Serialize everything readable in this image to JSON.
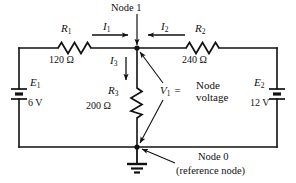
{
  "diagram": {
    "ink_color": "#111111",
    "background_color": "#ffffff"
  },
  "nodes": {
    "node1": {
      "label": "Node 1",
      "x": 137,
      "y": 48
    },
    "node0": {
      "label": "Node 0",
      "sublabel": "(reference node)",
      "x": 137,
      "y": 147
    }
  },
  "sources": [
    {
      "id": "E1",
      "symbol": "E",
      "subscript": "1",
      "value": "6 V",
      "side": "left"
    },
    {
      "id": "E2",
      "symbol": "E",
      "subscript": "2",
      "value": "12 V",
      "side": "right"
    }
  ],
  "resistors": [
    {
      "id": "R1",
      "symbol": "R",
      "subscript": "1",
      "value": "120 Ω",
      "orientation": "horizontal",
      "position": "top-left"
    },
    {
      "id": "R2",
      "symbol": "R",
      "subscript": "2",
      "value": "240 Ω",
      "orientation": "horizontal",
      "position": "top-right"
    },
    {
      "id": "R3",
      "symbol": "R",
      "subscript": "3",
      "value": "200 Ω",
      "orientation": "vertical",
      "position": "center"
    }
  ],
  "currents": [
    {
      "id": "I1",
      "symbol": "I",
      "subscript": "1",
      "direction": "right"
    },
    {
      "id": "I2",
      "symbol": "I",
      "subscript": "2",
      "direction": "left"
    },
    {
      "id": "I3",
      "symbol": "I",
      "subscript": "3",
      "direction": "down"
    }
  ],
  "annotations": {
    "node_voltage": {
      "symbol": "V",
      "subscript": "1",
      "equals": "=",
      "line1": "Node",
      "line2": "voltage"
    }
  },
  "icons": {
    "ground": "ground-icon",
    "battery": "battery-icon",
    "resistor": "resistor-icon",
    "junction": "junction-dot-icon"
  }
}
